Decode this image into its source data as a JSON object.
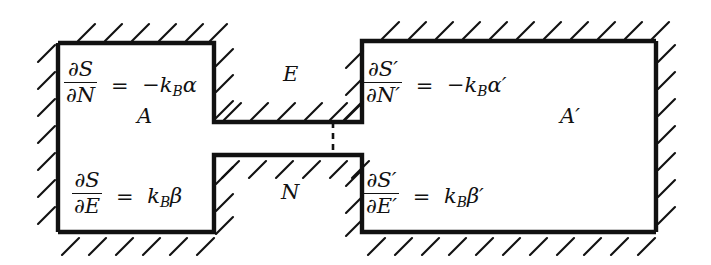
{
  "figure": {
    "kind": "thermodynamic-contact-diagram",
    "ink_color": "#111111",
    "background_color": "#ffffff"
  },
  "systems": {
    "left": {
      "name": "A",
      "equations": {
        "chemical": {
          "numerator": "∂S",
          "denominator": "∂N",
          "equals": "=",
          "rhs_prefix": "−",
          "rhs_symbol": "k",
          "rhs_subscript": "B",
          "rhs_variable": "α",
          "rhs_prime": "",
          "plain": "∂S/∂N = −k_Bα"
        },
        "thermal": {
          "numerator": "∂S",
          "denominator": "∂E",
          "equals": "=",
          "rhs_prefix": "",
          "rhs_symbol": "k",
          "rhs_subscript": "B",
          "rhs_variable": "β",
          "rhs_prime": "",
          "plain": "∂S/∂E = k_Bβ"
        }
      }
    },
    "right": {
      "name": "A′",
      "equations": {
        "chemical": {
          "numerator": "∂S′",
          "denominator": "∂N′",
          "equals": "=",
          "rhs_prefix": "−",
          "rhs_symbol": "k",
          "rhs_subscript": "B",
          "rhs_variable": "α",
          "rhs_prime": "′",
          "plain": "∂S′/∂N′ = −k_Bα′"
        },
        "thermal": {
          "numerator": "∂S′",
          "denominator": "∂E′",
          "equals": "=",
          "rhs_prefix": "",
          "rhs_symbol": "k",
          "rhs_subscript": "B",
          "rhs_variable": "β",
          "rhs_prime": "′",
          "plain": "∂S′/∂E′ = k_Bβ′"
        }
      }
    }
  },
  "exchange_labels": {
    "energy": "E",
    "particles": "N"
  },
  "partition": {
    "style": "dashed",
    "orientation": "vertical"
  }
}
